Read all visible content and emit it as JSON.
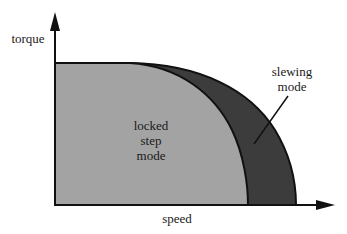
{
  "diagram": {
    "axes": {
      "y_label": "torque",
      "x_label": "speed"
    },
    "regions": [
      {
        "name": "locked step mode",
        "lines": [
          "locked",
          "step",
          "mode"
        ],
        "color": "#a3a3a3"
      },
      {
        "name": "slewing mode",
        "lines": [
          "slewing",
          "mode"
        ],
        "color": "#3c3c3c"
      }
    ]
  }
}
